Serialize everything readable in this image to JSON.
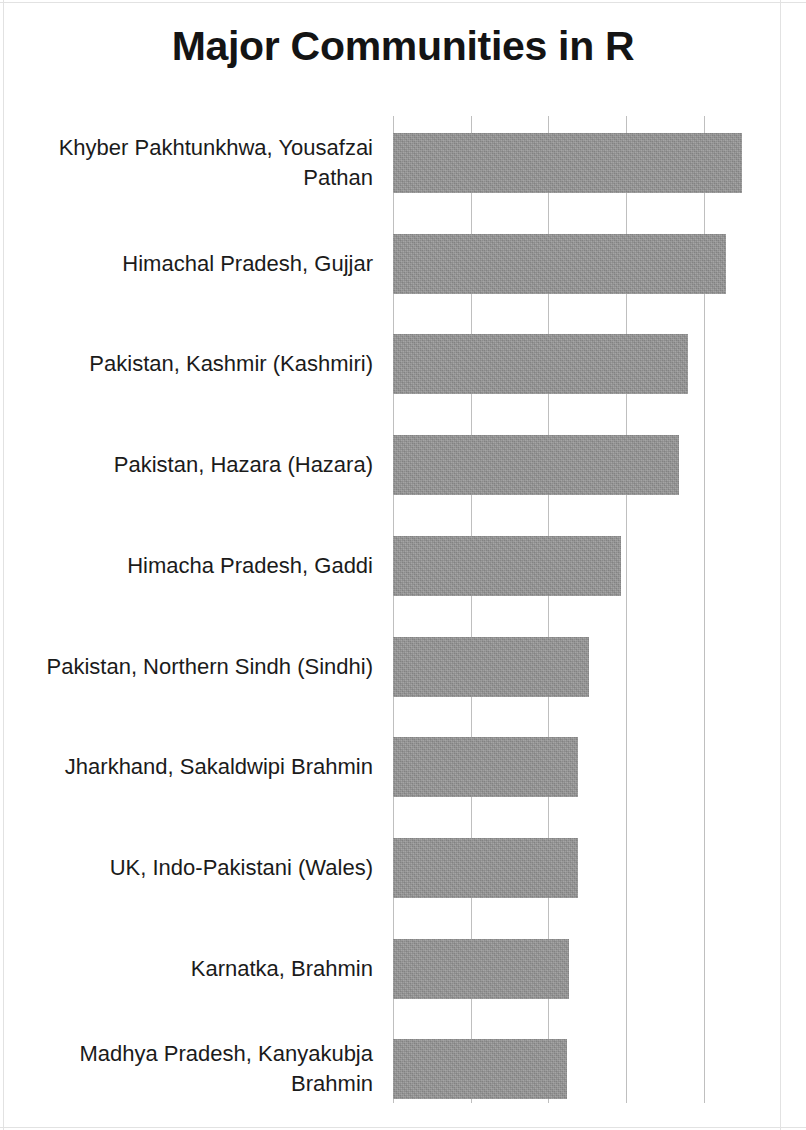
{
  "title": "Major Communities in R",
  "chart_data": {
    "type": "bar",
    "orientation": "horizontal",
    "title": "Major Communities in R",
    "xlabel": "",
    "ylabel": "",
    "grid": true,
    "gridlines_x": [
      0,
      1,
      2,
      3,
      4
    ],
    "legend": null,
    "axis_tick_labels": [],
    "xlim": [
      0,
      5
    ],
    "categories": [
      "Khyber Pakhtunkhwa, Yousafzai Pathan",
      "Himachal Pradesh, Gujjar",
      "Pakistan, Kashmir (Kashmiri)",
      "Pakistan, Hazara (Hazara)",
      "Himacha Pradesh, Gaddi",
      "Pakistan, Northern Sindh (Sindhi)",
      "Jharkhand, Sakaldwipi Brahmin",
      "UK, Indo-Pakistani (Wales)",
      "Karnatka, Brahmin",
      "Madhya Pradesh, Kanyakubja Brahmin"
    ],
    "values": [
      4.49,
      4.28,
      3.79,
      3.68,
      2.93,
      2.52,
      2.38,
      2.38,
      2.26,
      2.24
    ],
    "bar_color": "#979797"
  },
  "bars": [
    {
      "label": "Khyber Pakhtunkhwa, Yousafzai Pathan",
      "value": 4.49
    },
    {
      "label": "Himachal Pradesh, Gujjar",
      "value": 4.28
    },
    {
      "label": "Pakistan, Kashmir (Kashmiri)",
      "value": 3.79
    },
    {
      "label": "Pakistan, Hazara (Hazara)",
      "value": 3.68
    },
    {
      "label": "Himacha Pradesh, Gaddi",
      "value": 2.93
    },
    {
      "label": "Pakistan, Northern Sindh (Sindhi)",
      "value": 2.52
    },
    {
      "label": "Jharkhand, Sakaldwipi Brahmin",
      "value": 2.38
    },
    {
      "label": "UK, Indo-Pakistani (Wales)",
      "value": 2.38
    },
    {
      "label": "Karnatka, Brahmin",
      "value": 2.26
    },
    {
      "label": "Madhya Pradesh, Kanyakubja Brahmin",
      "value": 2.24
    }
  ],
  "geometry": {
    "axis_x": 392.7,
    "unit_px": 77.8,
    "first_bar_top": 133,
    "row_pitch": 100.7,
    "bar_height": 60,
    "grid_top": 116,
    "grid_height": 987,
    "tick_count": 5
  }
}
